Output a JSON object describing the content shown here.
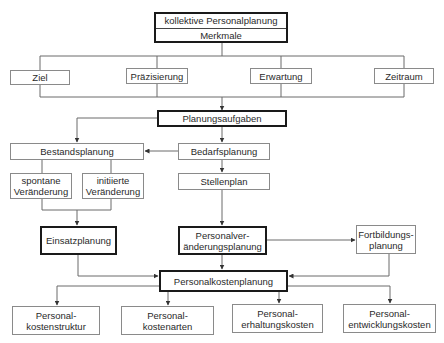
{
  "diagram": {
    "top": {
      "title": "kollektive Personalplanung",
      "subtitle": "Merkmale"
    },
    "merkmale": [
      "Ziel",
      "Präzisierung",
      "Erwartung",
      "Zeitraum"
    ],
    "planungsaufgaben": "Planungsaufgaben",
    "bestandsplanung": "Bestandsplanung",
    "bedarfsplanung": "Bedarfsplanung",
    "spontane": {
      "line1": "spontane",
      "line2": "Veränderung"
    },
    "initiierte": {
      "line1": "initiierte",
      "line2": "Veränderung"
    },
    "stellenplan": "Stellenplan",
    "einsatzplanung": "Einsatzplanung",
    "personalveraenderung": {
      "line1": "Personalver-",
      "line2": "änderungsplanung"
    },
    "fortbildung": {
      "line1": "Fortbildungs-",
      "line2": "planung"
    },
    "personalkostenplanung": "Personalkostenplanung",
    "kosten": [
      {
        "line1": "Personal-",
        "line2": "kostenstruktur"
      },
      {
        "line1": "Personal-",
        "line2": "kostenarten"
      },
      {
        "line1": "Personal-",
        "line2": "erhaltungskosten"
      },
      {
        "line1": "Personal-",
        "line2": "entwicklungskosten"
      }
    ]
  },
  "colors": {
    "line": "#6a6a6a",
    "thick_border": "#1a1a1a",
    "thin_border": "#8a8a8a"
  }
}
